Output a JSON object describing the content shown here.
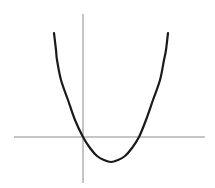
{
  "chart_data": {
    "type": "line",
    "title": "",
    "xlabel": "",
    "ylabel": "",
    "grid": false,
    "legend": null,
    "series": [
      {
        "name": "parabola",
        "color": "#1a1a1a",
        "x": [
          -1.04,
          -0.93,
          -0.54,
          0.0,
          0.5,
          1.0,
          1.5,
          2.0,
          2.54,
          2.93,
          3.04
        ],
        "y": [
          4.16,
          3.08,
          1.48,
          0.0,
          -0.68,
          -1.0,
          -0.68,
          0.0,
          1.48,
          3.08,
          4.16
        ]
      }
    ],
    "axes": {
      "color": "#8a8a8a",
      "x_axis": {
        "from": -2.46,
        "to": 4.38
      },
      "y_axis": {
        "from": -1.84,
        "to": 4.92
      }
    },
    "xlim": [
      -2.46,
      4.38
    ],
    "ylim": [
      -1.84,
      4.92
    ]
  },
  "mapping": {
    "origin_px": [
      83,
      137
    ],
    "px_per_unit_x": 28,
    "px_per_unit_y": 25
  },
  "pixel_curve": [
    [
      54,
      33
    ],
    [
      56,
      50
    ],
    [
      57,
      60
    ],
    [
      61,
      80
    ],
    [
      68,
      100
    ],
    [
      75,
      120
    ],
    [
      83,
      137
    ],
    [
      90,
      148
    ],
    [
      97,
      156
    ],
    [
      104,
      160
    ],
    [
      111,
      162
    ],
    [
      118,
      160
    ],
    [
      125,
      156
    ],
    [
      132,
      148
    ],
    [
      139,
      137
    ],
    [
      146,
      120
    ],
    [
      153,
      100
    ],
    [
      160,
      80
    ],
    [
      164,
      60
    ],
    [
      166,
      50
    ],
    [
      168,
      33
    ]
  ]
}
